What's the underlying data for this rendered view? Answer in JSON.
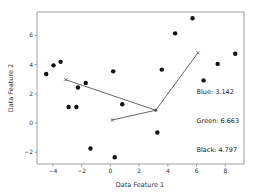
{
  "chart_data": {
    "type": "scatter",
    "title": "",
    "xlabel": "Data Feature 1",
    "ylabel": "Data Feature 2",
    "xlim": [
      -5.1,
      9.3
    ],
    "ylim": [
      -2.8,
      7.6
    ],
    "xticks": [
      -4,
      -2,
      0,
      2,
      4,
      6,
      8
    ],
    "yticks": [
      -2,
      0,
      2,
      4,
      6
    ],
    "xtick_labels": [
      "−4",
      "−2",
      "0",
      "2",
      "4",
      "6",
      "8"
    ],
    "ytick_labels": [
      "−2",
      "0",
      "2",
      "4",
      "6"
    ],
    "grid": false,
    "points": [
      {
        "x": -4.46,
        "y": 3.36
      },
      {
        "x": -3.95,
        "y": 3.95
      },
      {
        "x": -3.46,
        "y": 4.19
      },
      {
        "x": -2.25,
        "y": 2.43
      },
      {
        "x": -1.71,
        "y": 2.74
      },
      {
        "x": -2.9,
        "y": 1.1
      },
      {
        "x": -2.36,
        "y": 1.1
      },
      {
        "x": 0.2,
        "y": 3.54
      },
      {
        "x": 0.83,
        "y": 1.29
      },
      {
        "x": -1.38,
        "y": -1.74
      },
      {
        "x": 0.31,
        "y": -2.34
      },
      {
        "x": 3.27,
        "y": -0.64
      },
      {
        "x": 3.58,
        "y": 3.66
      },
      {
        "x": 4.51,
        "y": 6.14
      },
      {
        "x": 5.72,
        "y": 7.17
      },
      {
        "x": 6.49,
        "y": 2.92
      },
      {
        "x": 7.47,
        "y": 4.05
      },
      {
        "x": 8.69,
        "y": 4.74
      }
    ],
    "center": {
      "x": 3.16,
      "y": 0.88
    },
    "markers": [
      {
        "name": "blue",
        "x": 0.13,
        "y": 0.21
      },
      {
        "name": "green",
        "x": 6.1,
        "y": 4.81
      },
      {
        "name": "black",
        "x": -3.11,
        "y": 2.97
      }
    ],
    "annotations": [
      {
        "label": "Blue: 3.142",
        "x": 6.0,
        "y": 2.0
      },
      {
        "label": "Green: 6.663",
        "x": 6.0,
        "y": 0.0
      },
      {
        "label": "Black: 4.797",
        "x": 6.0,
        "y": -2.0
      }
    ],
    "colors": {
      "points": "#111111",
      "lines": "#555555",
      "axes": "#888888"
    }
  }
}
